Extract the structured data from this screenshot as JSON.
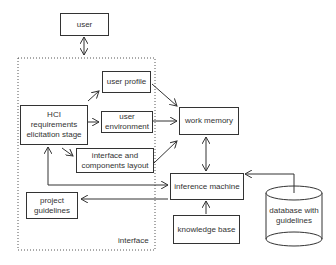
{
  "diagram": {
    "nodes": {
      "user": "user",
      "user_profile": "user profile",
      "hci_requirements": "HCI requirements elicitation stage",
      "user_environment": "user environment",
      "work_memory": "work memory",
      "interface_layout": "interface and components layout",
      "inference_machine": "inference machine",
      "project_guidelines": "project guidelines",
      "knowledge_base": "knowledge base",
      "database": "database with guidelines"
    },
    "group_label": "interface",
    "edges": [
      {
        "from": "user",
        "to": "interface",
        "type": "bidirectional"
      },
      {
        "from": "hci_requirements",
        "to": "user_profile"
      },
      {
        "from": "hci_requirements",
        "to": "user_environment"
      },
      {
        "from": "hci_requirements",
        "to": "interface_layout"
      },
      {
        "from": "user_profile",
        "to": "work_memory"
      },
      {
        "from": "user_environment",
        "to": "work_memory"
      },
      {
        "from": "interface_layout",
        "to": "work_memory"
      },
      {
        "from": "work_memory",
        "to": "inference_machine",
        "type": "bidirectional"
      },
      {
        "from": "hci_requirements",
        "to": "inference_machine",
        "type": "bidirectional"
      },
      {
        "from": "inference_machine",
        "to": "project_guidelines"
      },
      {
        "from": "knowledge_base",
        "to": "inference_machine"
      },
      {
        "from": "database",
        "to": "inference_machine"
      }
    ]
  }
}
